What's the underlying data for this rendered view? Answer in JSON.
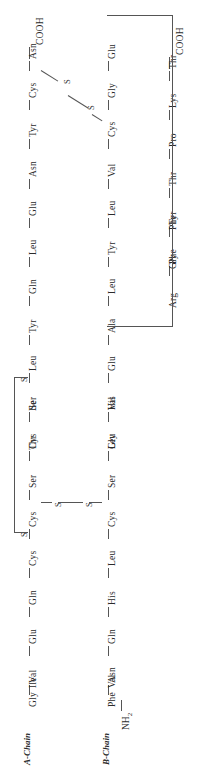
{
  "figure": {
    "chain_labels": {
      "a": "A-Chain",
      "b": "B-Chain"
    },
    "terminals": {
      "cooh": "COOH",
      "nh2": "NH2"
    },
    "sulfur_symbol": "S",
    "bond_color": "#555555",
    "text_color": "#2b2b2b",
    "background": "#ffffff"
  },
  "columns": {
    "a_chain": {
      "name": "A-Chain",
      "terminal_top": "COOH",
      "residues": [
        "Asn",
        "Cys",
        "Tyr",
        "Asn",
        "Glu",
        "Leu",
        "Gln",
        "Tyr",
        "Leu",
        "Ser",
        "Cys",
        "Ile",
        "Ser",
        "Thr",
        "Cys",
        "Cys",
        "Gln",
        "Glu",
        "Val",
        "Ile",
        "Gly"
      ]
    },
    "b_chain_upper": {
      "name": "B-Chain upper run",
      "residues": [
        "Glu",
        "Gly",
        "Cys",
        "Val",
        "Leu",
        "Tyr",
        "Leu",
        "Ala",
        "Glu",
        "Val",
        "Leu",
        "His",
        "Ser",
        "Gly",
        "Cys",
        "Leu",
        "His",
        "Gln",
        "Asn",
        "Val",
        "Phe"
      ],
      "terminal_bottom": "NH2"
    },
    "b_chain_tail": {
      "name": "B-Chain C-terminal run",
      "terminal_top": "COOH",
      "residues": [
        "Thr",
        "Lys",
        "Pro",
        "Thr",
        "Tyr",
        "Phe",
        "Phe",
        "Gly",
        "Arg"
      ]
    }
  },
  "disulfide_bonds": [
    {
      "id": "A7-B7",
      "label_left": "S",
      "label_right": "S",
      "style": "diagonal"
    },
    {
      "id": "A20-B19",
      "label_left": "S",
      "label_right": "S",
      "style": "horizontal"
    },
    {
      "id": "A6-A11",
      "label_top": "S",
      "label_bottom": "S",
      "style": "intrachain-loop"
    }
  ]
}
